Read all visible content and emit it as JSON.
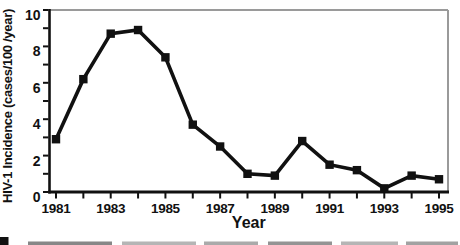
{
  "chart_data": {
    "type": "line",
    "title": "",
    "xlabel": "Year",
    "ylabel": "HIV-1 Incidence (cases/100 /year)",
    "x": [
      1981,
      1982,
      1983,
      1984,
      1985,
      1986,
      1987,
      1988,
      1989,
      1990,
      1991,
      1992,
      1993,
      1994,
      1995
    ],
    "values": [
      2.9,
      6.2,
      8.7,
      8.9,
      7.4,
      3.7,
      2.5,
      1.0,
      0.9,
      2.8,
      1.5,
      1.2,
      0.2,
      0.9,
      0.7
    ],
    "xlim": [
      1981,
      1995
    ],
    "ylim": [
      0,
      10
    ],
    "x_labeled_ticks": [
      1981,
      1983,
      1985,
      1987,
      1989,
      1991,
      1993,
      1995
    ],
    "y_labeled_ticks": [
      0,
      2,
      4,
      6,
      8,
      10
    ],
    "x_minor_tick_step": 1,
    "y_minor_tick_step": 1,
    "grid": false,
    "legend": "none",
    "line_color": "#111111",
    "marker": "filled-square",
    "border_color": "#9a9a9a"
  },
  "bottom_caption_fragment": {
    "bullet_icon": "black-square-marker"
  }
}
